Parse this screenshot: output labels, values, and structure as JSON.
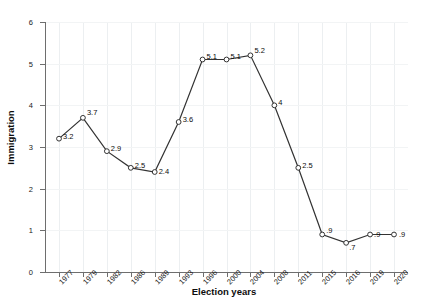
{
  "chart_data": {
    "type": "line",
    "title": "",
    "xlabel": "Election years",
    "ylabel": "Immigration",
    "categories": [
      "1977",
      "1979",
      "1982",
      "1986",
      "1989",
      "1993",
      "1996",
      "2000",
      "2004",
      "2008",
      "2011",
      "2015",
      "2016",
      "2019",
      "2020"
    ],
    "values": [
      3.2,
      3.7,
      2.9,
      2.5,
      2.4,
      3.6,
      5.1,
      5.1,
      5.2,
      4,
      2.5,
      0.9,
      0.7,
      0.9,
      0.9
    ],
    "point_labels": [
      "3.2",
      "3.7",
      "2.9",
      "2.5",
      "2.4",
      "3.6",
      "5.1",
      "5.1",
      "5.2",
      "4",
      "2.5",
      ".9",
      ".7",
      ".9",
      ".9"
    ],
    "ylim": [
      0,
      6
    ],
    "yticks": [
      "0",
      "1",
      "2",
      "3",
      "4",
      "5",
      "6"
    ],
    "grid": true,
    "legend": "none",
    "marker": "open-circle",
    "line_color": "#333333",
    "marker_color": "#333333"
  }
}
